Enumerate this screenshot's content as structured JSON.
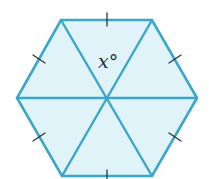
{
  "figure": {
    "shape": "regular hexagon divided into six equilateral triangles",
    "angle_label": "x°",
    "colors": {
      "fill": "#dff3f8",
      "stroke": "#3aa6cc",
      "tick": "#333333"
    },
    "vertices": [
      [
        61,
        20
      ],
      [
        152,
        20
      ],
      [
        197,
        98
      ],
      [
        152,
        176
      ],
      [
        62,
        176
      ],
      [
        17,
        98
      ]
    ],
    "center": [
      107,
      98
    ],
    "tick_marks_per_side": 1
  }
}
